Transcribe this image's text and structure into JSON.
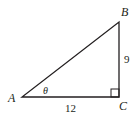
{
  "diagram": {
    "type": "right-triangle",
    "vertices": {
      "A": {
        "label": "A"
      },
      "B": {
        "label": "B"
      },
      "C": {
        "label": "C"
      }
    },
    "angle_label": "θ",
    "sides": {
      "AC": {
        "label": "12"
      },
      "BC": {
        "label": "9"
      }
    },
    "right_angle_at": "C",
    "colors": {
      "stroke": "#231f20",
      "background": "#ffffff"
    }
  }
}
